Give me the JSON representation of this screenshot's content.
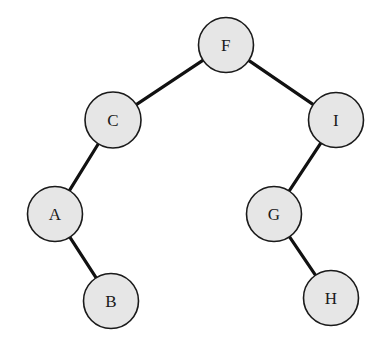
{
  "diagram": {
    "type": "binary-search-tree",
    "title": "",
    "background_color": "#ffffff",
    "node_fill_color": "#e6e6e6",
    "node_stroke_color": "#1a1a1a",
    "edge_color": "#111111",
    "node_radius": 27.5,
    "canvas": {
      "width": 389,
      "height": 344
    },
    "nodes": [
      {
        "id": "F",
        "label": "F",
        "cx": 226,
        "cy": 45,
        "r": 27.5,
        "role": "root"
      },
      {
        "id": "C",
        "label": "C",
        "cx": 113,
        "cy": 120,
        "r": 28.0,
        "role": "left-child-of-F"
      },
      {
        "id": "I",
        "label": "I",
        "cx": 336,
        "cy": 120,
        "r": 27.5,
        "role": "right-child-of-F"
      },
      {
        "id": "A",
        "label": "A",
        "cx": 55,
        "cy": 214,
        "r": 27.5,
        "role": "left-child-of-C"
      },
      {
        "id": "G",
        "label": "G",
        "cx": 274,
        "cy": 214,
        "r": 27.5,
        "role": "left-child-of-I"
      },
      {
        "id": "B",
        "label": "B",
        "cx": 111,
        "cy": 301,
        "r": 27.5,
        "role": "right-child-of-A"
      },
      {
        "id": "H",
        "label": "H",
        "cx": 331,
        "cy": 298,
        "r": 27.5,
        "role": "right-child-of-G"
      }
    ],
    "edges": [
      {
        "from": "F",
        "to": "C",
        "label": ""
      },
      {
        "from": "F",
        "to": "I",
        "label": ""
      },
      {
        "from": "C",
        "to": "A",
        "label": ""
      },
      {
        "from": "A",
        "to": "B",
        "label": ""
      },
      {
        "from": "I",
        "to": "G",
        "label": ""
      },
      {
        "from": "G",
        "to": "H",
        "label": ""
      }
    ]
  }
}
